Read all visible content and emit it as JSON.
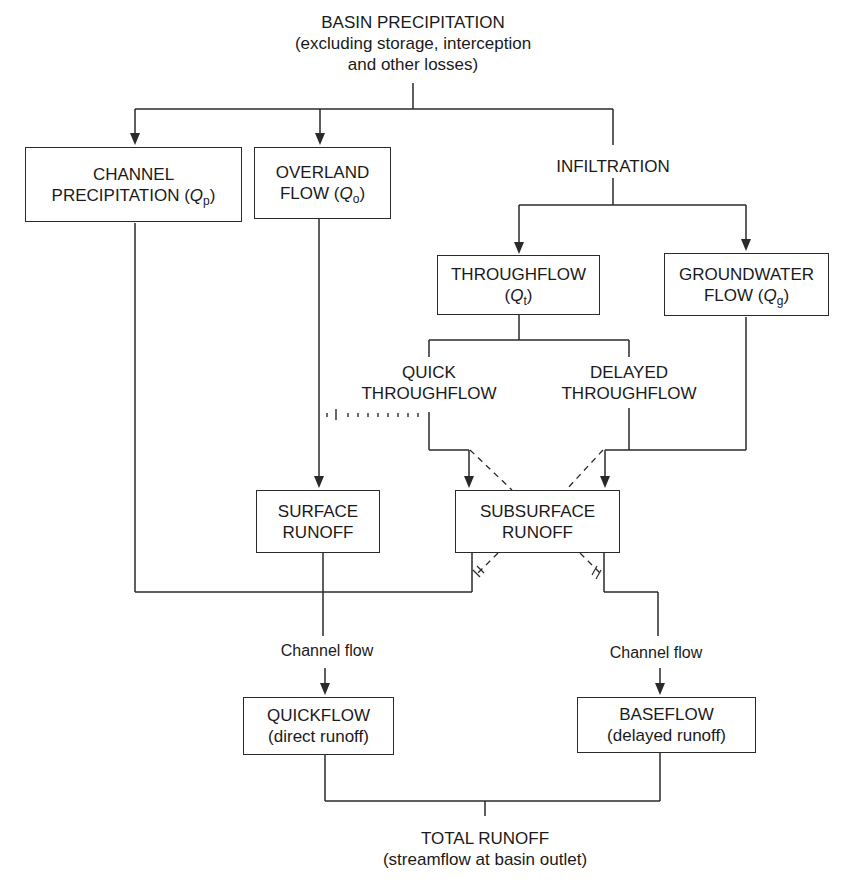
{
  "diagram": {
    "type": "flowchart"
  },
  "nodes": {
    "basin_precipitation": {
      "line1": "BASIN PRECIPITATION",
      "line2": "(excluding storage, interception",
      "line3": "and other losses)"
    },
    "channel_precipitation": {
      "line1": "CHANNEL",
      "line2": "PRECIPITATION (",
      "symbol": "Q",
      "subscript": "p",
      "close": ")"
    },
    "overland_flow": {
      "line1": "OVERLAND",
      "line2": "FLOW (",
      "symbol": "Q",
      "subscript": "o",
      "close": ")"
    },
    "infiltration": {
      "line1": "INFILTRATION"
    },
    "throughflow": {
      "line1": "THROUGHFLOW",
      "line2": "(",
      "symbol": "Q",
      "subscript": "t",
      "close": ")"
    },
    "groundwater_flow": {
      "line1": "GROUNDWATER",
      "line2": "FLOW (",
      "symbol": "Q",
      "subscript": "g",
      "close": ")"
    },
    "quick_throughflow": {
      "line1": "QUICK",
      "line2": "THROUGHFLOW"
    },
    "delayed_throughflow": {
      "line1": "DELAYED",
      "line2": "THROUGHFLOW"
    },
    "surface_runoff": {
      "line1": "SURFACE",
      "line2": "RUNOFF"
    },
    "subsurface_runoff": {
      "line1": "SUBSURFACE",
      "line2": "RUNOFF"
    },
    "channel_flow_left": {
      "line1": "Channel flow"
    },
    "channel_flow_right": {
      "line1": "Channel flow"
    },
    "quickflow": {
      "line1": "QUICKFLOW",
      "line2": "(direct runoff)"
    },
    "baseflow": {
      "line1": "BASEFLOW",
      "line2": "(delayed runoff)"
    },
    "total_runoff": {
      "line1": "TOTAL RUNOFF",
      "line2": "(streamflow at basin outlet)"
    }
  },
  "edges": [
    {
      "from": "basin_precipitation",
      "to": "channel_precipitation",
      "style": "solid",
      "arrow": true
    },
    {
      "from": "basin_precipitation",
      "to": "overland_flow",
      "style": "solid",
      "arrow": true
    },
    {
      "from": "basin_precipitation",
      "to": "infiltration",
      "style": "solid",
      "arrow": false
    },
    {
      "from": "infiltration",
      "to": "throughflow",
      "style": "solid",
      "arrow": true
    },
    {
      "from": "infiltration",
      "to": "groundwater_flow",
      "style": "solid",
      "arrow": true
    },
    {
      "from": "throughflow",
      "to": "quick_throughflow",
      "style": "solid",
      "arrow": false
    },
    {
      "from": "throughflow",
      "to": "delayed_throughflow",
      "style": "solid",
      "arrow": false
    },
    {
      "from": "quick_throughflow",
      "to": "subsurface_runoff",
      "style": "solid",
      "arrow": true
    },
    {
      "from": "quick_throughflow",
      "to": "overland_flow",
      "style": "dotted",
      "arrow": false
    },
    {
      "from": "delayed_throughflow",
      "to": "subsurface_runoff",
      "style": "solid",
      "arrow": true
    },
    {
      "from": "groundwater_flow",
      "to": "subsurface_runoff",
      "style": "solid",
      "arrow": true
    },
    {
      "from": "overland_flow",
      "to": "surface_runoff",
      "style": "solid",
      "arrow": true
    },
    {
      "from": "quick_throughflow",
      "to": "baseflow",
      "style": "dashed",
      "arrow": false
    },
    {
      "from": "delayed_throughflow",
      "to": "quickflow",
      "style": "dashed",
      "arrow": false
    },
    {
      "from": "channel_precipitation",
      "to": "quickflow",
      "style": "solid",
      "arrow": false
    },
    {
      "from": "subsurface_runoff",
      "to": "quickflow",
      "style": "solid",
      "arrow": false
    },
    {
      "from": "surface_runoff",
      "to": "quickflow",
      "style": "solid",
      "arrow": true,
      "label": "Channel flow"
    },
    {
      "from": "subsurface_runoff",
      "to": "baseflow",
      "style": "solid",
      "arrow": true,
      "label": "Channel flow"
    },
    {
      "from": "quickflow",
      "to": "total_runoff",
      "style": "solid",
      "arrow": false
    },
    {
      "from": "baseflow",
      "to": "total_runoff",
      "style": "solid",
      "arrow": false
    }
  ],
  "colors": {
    "line": "#2a2a2a",
    "background": "#ffffff",
    "text": "#1a1a1a"
  }
}
